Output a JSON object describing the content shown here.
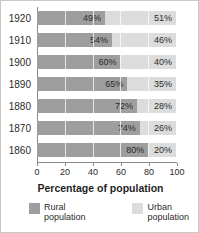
{
  "chart_data": {
    "type": "bar",
    "subtype": "stacked-horizontal-100",
    "title": "",
    "xlabel": "Percentage of population",
    "ylabel": "",
    "xlim": [
      0,
      100
    ],
    "xticks": [
      0,
      20,
      40,
      60,
      80,
      100
    ],
    "xtick_labels": [
      "0",
      "20",
      "40",
      "60",
      "80",
      "100"
    ],
    "grid": true,
    "grid_axis": "x",
    "legend_position": "bottom",
    "categories": [
      "1920",
      "1910",
      "1900",
      "1890",
      "1880",
      "1870",
      "1860"
    ],
    "series": [
      {
        "name": "Rural population",
        "color": "#9e9e9e",
        "values": [
          49,
          54,
          60,
          65,
          72,
          74,
          80
        ],
        "labels": [
          "49%",
          "54%",
          "60%",
          "65%",
          "72%",
          "74%",
          "80%"
        ]
      },
      {
        "name": "Urban population",
        "color": "#dcdcdc",
        "values": [
          51,
          46,
          40,
          35,
          28,
          26,
          20
        ],
        "labels": [
          "51%",
          "46%",
          "40%",
          "35%",
          "28%",
          "26%",
          "20%"
        ]
      }
    ],
    "rows": [
      {
        "year": "1920",
        "rural": 49,
        "urban": 51,
        "rural_label": "49%",
        "urban_label": "51%"
      },
      {
        "year": "1910",
        "rural": 54,
        "urban": 46,
        "rural_label": "54%",
        "urban_label": "46%"
      },
      {
        "year": "1900",
        "rural": 60,
        "urban": 40,
        "rural_label": "60%",
        "urban_label": "40%"
      },
      {
        "year": "1890",
        "rural": 65,
        "urban": 35,
        "rural_label": "65%",
        "urban_label": "35%"
      },
      {
        "year": "1880",
        "rural": 72,
        "urban": 28,
        "rural_label": "72%",
        "urban_label": "28%"
      },
      {
        "year": "1870",
        "rural": 74,
        "urban": 26,
        "rural_label": "74%",
        "urban_label": "26%"
      },
      {
        "year": "1860",
        "rural": 80,
        "urban": 20,
        "rural_label": "80%",
        "urban_label": "20%"
      }
    ]
  },
  "axis_title": "Percentage of population",
  "legend": {
    "rural": {
      "line1": "Rural",
      "line2": "population"
    },
    "urban": {
      "line1": "Urban",
      "line2": "population"
    }
  },
  "colors": {
    "rural": "#9e9e9e",
    "urban": "#dcdcdc",
    "axis": "#8a8a8a",
    "text": "#2b2b2b",
    "border": "#c8c8c8"
  }
}
